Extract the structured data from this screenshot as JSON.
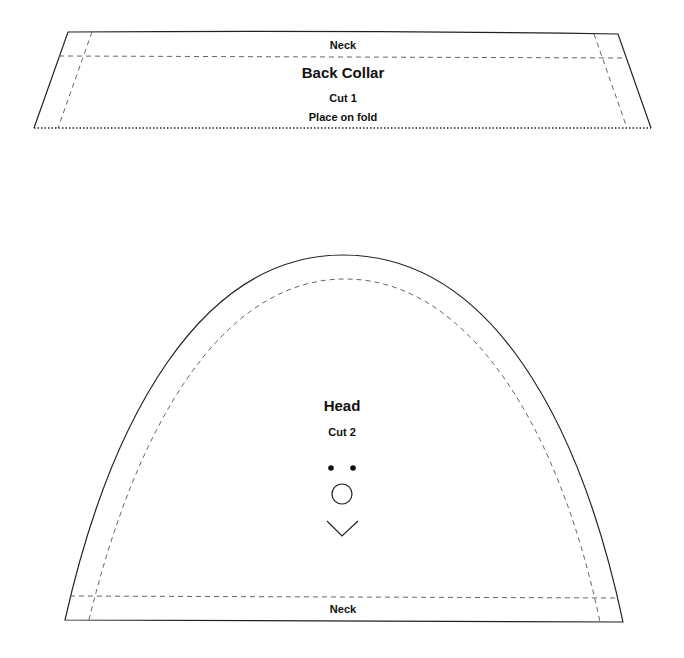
{
  "back_collar": {
    "neck_label": "Neck",
    "title": "Back Collar",
    "cut": "Cut 1",
    "fold_note": "Place on fold"
  },
  "head": {
    "title": "Head",
    "cut": "Cut 2",
    "neck_label": "Neck",
    "markings": [
      "eye-dot-left",
      "eye-dot-right",
      "nose-circle",
      "mouth-v"
    ]
  },
  "colors": {
    "line": "#222222",
    "seam": "#555555",
    "background": "#ffffff"
  }
}
